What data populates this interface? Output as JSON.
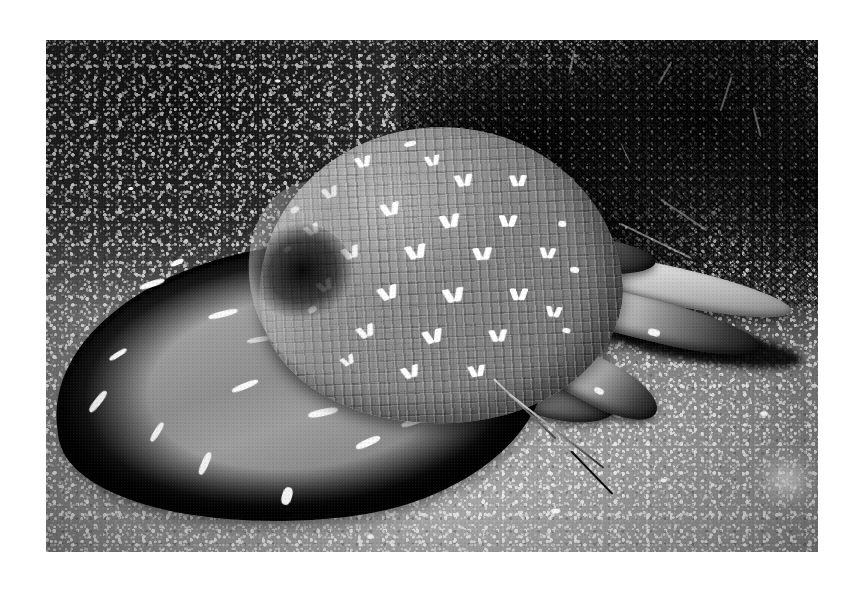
{
  "page": {
    "background_color": "#ffffff",
    "width": 863,
    "height": 593
  },
  "photo": {
    "name": "hermit-crab-in-shell-photograph",
    "alt_text": "Black and white photograph of a hermit crab occupying a bonnet shell on coarse sand with dark algae behind",
    "frame": {
      "x": 46,
      "y": 40,
      "width": 772,
      "height": 512
    },
    "color_mode": "grayscale",
    "palette": {
      "paper_white": "#ffffff",
      "sand_light": "#a9a9a9",
      "sand_mid": "#6f6f6f",
      "sand_dark": "#2b2b2b",
      "algae_black": "#0a0a0a",
      "shell_mid_gray": "#8b8b8b",
      "shell_highlight": "#fbfbfb",
      "mantle_gray": "#9a9a9a",
      "shadow_black": "#080808"
    },
    "subjects": [
      {
        "name": "shell",
        "label": "Bonnet / helmet sea shell",
        "description": "Globose shell with fine cross-hatched grid of axial ribs and spiral grooves, decorated with rows of bright white chevron and V-shaped flecks",
        "position": "upper-center",
        "tone": "medium gray"
      },
      {
        "name": "mantle-foot",
        "label": "Pale mantle lobe",
        "description": "Broad fleshy pale-gray lobe fanning to the left, marked with irregular bright white streaks, rimmed by a dark shadow where it meets the sand",
        "position": "left-center",
        "tone": "light gray"
      },
      {
        "name": "crab-legs",
        "label": "Banded hermit crab legs",
        "description": "Several jointed walking legs with mottled black and white banding projecting to the right and lower-right",
        "position": "right-center",
        "tone": "high contrast black and white"
      },
      {
        "name": "antenna",
        "label": "Long slender antenna",
        "description": "Thin tapering antenna sweeping down toward the lower-right across the sand",
        "position": "lower-right"
      },
      {
        "name": "algae",
        "label": "Dark branching algae",
        "description": "Dense very dark bushy seaweed or soft coral filling the upper-right background",
        "position": "upper-right",
        "tone": "near black"
      },
      {
        "name": "sand",
        "label": "Coarse sand substrate",
        "description": "Granular seabed speckled with bright shell fragments, dark in the upper portion and brightly lit toward the lower edge",
        "position": "background",
        "tone": "dark to light gray gradient"
      }
    ]
  }
}
